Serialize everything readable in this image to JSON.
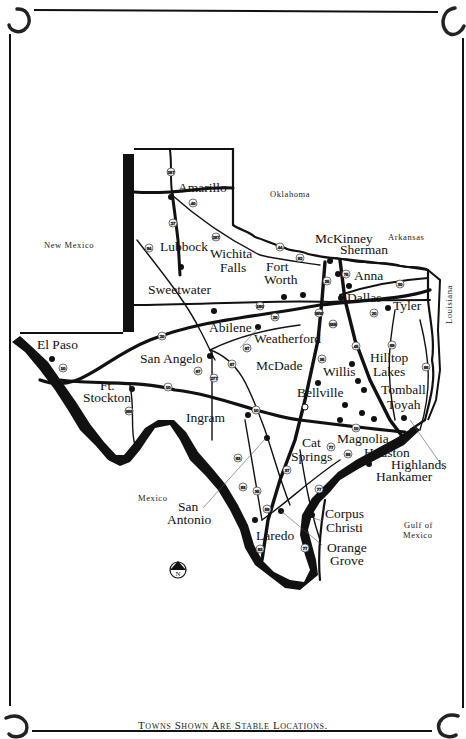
{
  "footer": "Towns Shown Are Stable Locations.",
  "regions": {
    "oklahoma": "Oklahoma",
    "arkansas": "Arkansas",
    "louisiana": "Louisiana",
    "new_mexico": "New Mexico",
    "mexico": "Mexico",
    "gulf_1": "Gulf of",
    "gulf_2": "Mexico"
  },
  "cities": {
    "amarillo": "Amarillo",
    "lubbock": "Lubbock",
    "wichita_1": "Wichita",
    "wichita_2": "Falls",
    "fortworth_1": "Fort",
    "fortworth_2": "Worth",
    "mckinney": "McKinney",
    "sherman": "Sherman",
    "anna": "Anna",
    "dallas": "Dallas",
    "tyler": "Tyler",
    "sweetwater": "Sweetwater",
    "abilene": "Abilene",
    "weatherford": "Weatherford",
    "elpaso": "El Paso",
    "sanangelo": "San Angelo",
    "mcdade": "McDade",
    "willis": "Willis",
    "hilltop_1": "Hilltop",
    "hilltop_2": "Lakes",
    "tomball": "Tomball",
    "toyah": "Toyah",
    "ftstockton_1": "Ft.",
    "ftstockton_2": "Stockton",
    "bellville": "Bellville",
    "ingram": "Ingram",
    "catsprings_1": "Cat",
    "catsprings_2": "Springs",
    "magnolia": "Magnolia",
    "houston": "Houston",
    "highlands": "Highlands",
    "hankamer": "Hankamer",
    "sanantonio_1": "San",
    "sanantonio_2": "Antonio",
    "corpus_1": "Corpus",
    "corpus_2": "Christi",
    "laredo": "Laredo",
    "orange_1": "Orange",
    "orange_2": "Grove"
  },
  "highways": {
    "h287": "287",
    "h40": "40",
    "h27": "27",
    "h84": "84",
    "h287b": "287",
    "h44": "44",
    "h82": "82",
    "h75": "75",
    "h35": "35",
    "h30": "30",
    "h20a": "20",
    "h180": "180",
    "h20b": "20",
    "h35w": "35W",
    "h35e": "35E",
    "h20c": "20",
    "h45": "45",
    "h69": "69",
    "h96": "96",
    "h67a": "67",
    "h87": "87",
    "h277": "277",
    "h67b": "67",
    "h10a": "10",
    "h10b": "10",
    "h385": "385",
    "h35b": "35",
    "h10c": "10",
    "h10d": "10",
    "h83a": "83",
    "h83b": "83",
    "h35c": "35",
    "h37": "37",
    "h77a": "77",
    "h59a": "59",
    "h59b": "59",
    "h77b": "77",
    "h83c": "83",
    "h77c": "77",
    "h20d": "20"
  },
  "compass": {
    "label": "N"
  },
  "colors": {
    "ink": "#111111",
    "background": "#ffffff"
  }
}
